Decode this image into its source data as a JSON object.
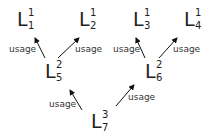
{
  "diagram": {
    "nodes": [
      {
        "id": "L11",
        "base": "L",
        "sup": "1",
        "sub": "1",
        "x": 17,
        "y": 8
      },
      {
        "id": "L21",
        "base": "L",
        "sup": "1",
        "sub": "2",
        "x": 80,
        "y": 8
      },
      {
        "id": "L31",
        "base": "L",
        "sup": "1",
        "sub": "3",
        "x": 133,
        "y": 8
      },
      {
        "id": "L41",
        "base": "L",
        "sup": "1",
        "sub": "4",
        "x": 184,
        "y": 8
      },
      {
        "id": "L52",
        "base": "L",
        "sup": "2",
        "sub": "5",
        "x": 45,
        "y": 60
      },
      {
        "id": "L62",
        "base": "L",
        "sup": "2",
        "sub": "6",
        "x": 145,
        "y": 60
      },
      {
        "id": "L73",
        "base": "L",
        "sup": "3",
        "sub": "7",
        "x": 91,
        "y": 110
      }
    ],
    "edges": [
      {
        "from": "L52",
        "to": "L11",
        "label": "usage"
      },
      {
        "from": "L52",
        "to": "L21",
        "label": "usage"
      },
      {
        "from": "L62",
        "to": "L31",
        "label": "usage"
      },
      {
        "from": "L62",
        "to": "L41",
        "label": "usage"
      },
      {
        "from": "L73",
        "to": "L52",
        "label": "usage"
      },
      {
        "from": "L73",
        "to": "L62",
        "label": "usage"
      }
    ],
    "labels": [
      "usage",
      "usage",
      "usage",
      "usage",
      "usage",
      "usage"
    ]
  }
}
